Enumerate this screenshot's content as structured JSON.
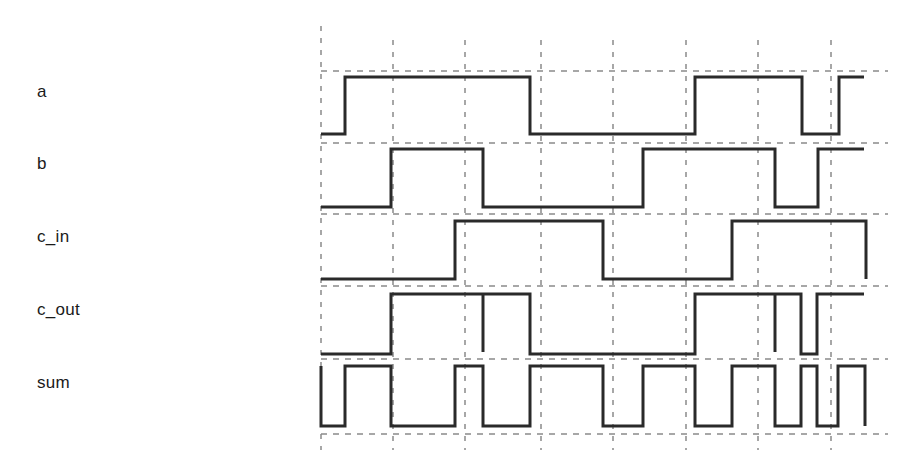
{
  "colors": {
    "background": "#ffffff",
    "signal": "#2a2a2a",
    "grid": "#8a8a8a",
    "label": "#1a1a1a"
  },
  "grid": {
    "x_lines": [
      321,
      393,
      465,
      541,
      613,
      686,
      758,
      831
    ],
    "y_lines": [
      71,
      143,
      214,
      286,
      359,
      434
    ],
    "x_start": 321,
    "x_end": 888,
    "y_top": 40,
    "y_bottom": 450
  },
  "signals": [
    {
      "name": "a",
      "label_y": 82,
      "high_y": 77,
      "low_y": 134,
      "initial": 0,
      "edges": [
        345,
        530,
        695,
        802,
        839
      ],
      "glitches": [],
      "end_x": 864
    },
    {
      "name": "b",
      "label_y": 154,
      "high_y": 149,
      "low_y": 207,
      "initial": 0,
      "edges": [
        391,
        483,
        643,
        775,
        818
      ],
      "glitches": [],
      "end_x": 864
    },
    {
      "name": "c_in",
      "label_y": 227,
      "high_y": 221,
      "low_y": 279,
      "initial": 0,
      "edges": [
        455,
        603,
        732,
        866
      ],
      "glitches": [],
      "end_x": 866
    },
    {
      "name": "c_out",
      "label_y": 300,
      "high_y": 294,
      "low_y": 354,
      "initial": 0,
      "edges": [
        391,
        530,
        695,
        801,
        817
      ],
      "glitches": [
        483,
        775
      ],
      "end_x": 864
    },
    {
      "name": "sum",
      "label_y": 373,
      "high_y": 366,
      "low_y": 426,
      "initial": 0,
      "start_from_high": true,
      "edges": [
        345,
        391,
        455,
        483,
        530,
        603,
        643,
        695,
        732,
        775,
        801,
        817,
        838,
        865
      ],
      "glitches": [],
      "end_x": 865
    }
  ],
  "chart_data": {
    "type": "timing",
    "title": "",
    "signals": [
      "a",
      "b",
      "c_in",
      "c_out",
      "sum"
    ],
    "time_divisions": 8,
    "waveforms": {
      "a": [
        [
          321,
          0
        ],
        [
          345,
          1
        ],
        [
          530,
          0
        ],
        [
          695,
          1
        ],
        [
          802,
          0
        ],
        [
          839,
          1
        ]
      ],
      "b": [
        [
          321,
          0
        ],
        [
          391,
          1
        ],
        [
          483,
          0
        ],
        [
          643,
          1
        ],
        [
          775,
          0
        ],
        [
          818,
          1
        ]
      ],
      "c_in": [
        [
          321,
          0
        ],
        [
          455,
          1
        ],
        [
          603,
          0
        ],
        [
          732,
          1
        ],
        [
          866,
          0
        ]
      ],
      "c_out": [
        [
          321,
          0
        ],
        [
          391,
          1
        ],
        [
          530,
          0
        ],
        [
          695,
          1
        ],
        [
          801,
          0
        ],
        [
          817,
          1
        ]
      ],
      "sum": [
        [
          321,
          0
        ],
        [
          345,
          1
        ],
        [
          391,
          0
        ],
        [
          455,
          1
        ],
        [
          483,
          0
        ],
        [
          530,
          1
        ],
        [
          603,
          0
        ],
        [
          643,
          1
        ],
        [
          695,
          0
        ],
        [
          732,
          1
        ],
        [
          775,
          0
        ],
        [
          801,
          1
        ],
        [
          817,
          0
        ],
        [
          838,
          1
        ],
        [
          865,
          0
        ]
      ]
    },
    "glitches": {
      "c_out": [
        483,
        775
      ]
    }
  }
}
